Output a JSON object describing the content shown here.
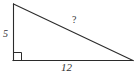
{
  "figure": {
    "type": "right-triangle-diagram",
    "background_color": "#ffffff",
    "stroke_color": "#2b2b2b",
    "text_color": "#333333",
    "vertices": {
      "top": {
        "x": 13,
        "y": 4
      },
      "bottom_left": {
        "x": 13,
        "y": 60
      },
      "bottom_right": {
        "x": 133,
        "y": 60
      }
    },
    "right_angle": {
      "at_vertex": "bottom_left",
      "marker": "square",
      "size": 8
    },
    "labels": {
      "vertical_leg": "5",
      "hypotenuse": "?",
      "horizontal_leg": "12"
    }
  }
}
